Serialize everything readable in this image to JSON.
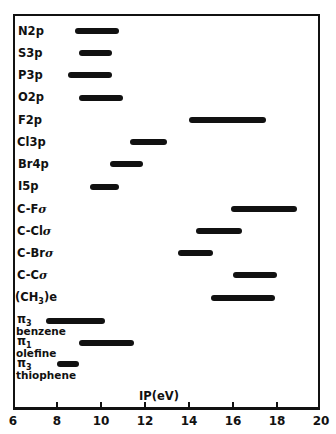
{
  "chart_data": {
    "type": "bar",
    "subtype": "horizontal floating range bars",
    "title": "",
    "xlabel": "IP(eV)",
    "ylabel": "",
    "xlim": [
      6,
      20
    ],
    "xticks": [
      6,
      8,
      10,
      12,
      14,
      16,
      18,
      20
    ],
    "grid": false,
    "legend": null,
    "categories": [
      "N2p",
      "S3p",
      "P3p",
      "O2p",
      "F2p",
      "Cl3p",
      "Br4p",
      "I5p",
      "C-Fσ",
      "C-Clσ",
      "C-Brσ",
      "C-Cσ",
      "(CH3)e",
      "π3 benzene",
      "π1 olefine",
      "π3 thiophene"
    ],
    "ranges": [
      {
        "label": "N2p",
        "start": 8.8,
        "end": 10.8
      },
      {
        "label": "S3p",
        "start": 9.0,
        "end": 10.5
      },
      {
        "label": "P3p",
        "start": 8.5,
        "end": 10.5
      },
      {
        "label": "O2p",
        "start": 9.0,
        "end": 11.0
      },
      {
        "label": "F2p",
        "start": 14.0,
        "end": 17.5
      },
      {
        "label": "Cl3p",
        "start": 11.3,
        "end": 13.0
      },
      {
        "label": "Br4p",
        "start": 10.4,
        "end": 11.9
      },
      {
        "label": "I5p",
        "start": 9.5,
        "end": 10.8
      },
      {
        "label": "C-Fσ",
        "start": 15.9,
        "end": 18.9
      },
      {
        "label": "C-Clσ",
        "start": 14.3,
        "end": 16.4
      },
      {
        "label": "C-Brσ",
        "start": 13.5,
        "end": 15.1
      },
      {
        "label": "C-Cσ",
        "start": 16.0,
        "end": 18.0
      },
      {
        "label": "(CH3)e",
        "start": 15.0,
        "end": 17.9
      },
      {
        "label": "π3 benzene",
        "start": 7.5,
        "end": 10.2
      },
      {
        "label": "π1 olefine",
        "start": 9.0,
        "end": 11.5
      },
      {
        "label": "π3 thiophene",
        "start": 8.0,
        "end": 9.0
      }
    ]
  },
  "labels": {
    "n2p": "N2p",
    "s3p": "S3p",
    "p3p": "P3p",
    "o2p": "O2p",
    "f2p": "F2p",
    "cl3p": "Cl3p",
    "br4p": "Br4p",
    "i5p": "I5p",
    "cf": "C-F",
    "ccl": "C-Cl",
    "cbr": "C-Br",
    "cc": "C-C",
    "sigma": "σ",
    "ch3_open": "(CH",
    "ch3_sub": "3",
    "ch3_close": ")e",
    "pi": "π",
    "pi3": "3",
    "pi1": "1",
    "benzene": "benzene",
    "olefine": "olefine",
    "thiophene": "thiophene"
  },
  "axis": {
    "xlabel": "IP(eV)",
    "ticks": [
      "6",
      "8",
      "10",
      "12",
      "14",
      "16",
      "18",
      "20"
    ]
  }
}
